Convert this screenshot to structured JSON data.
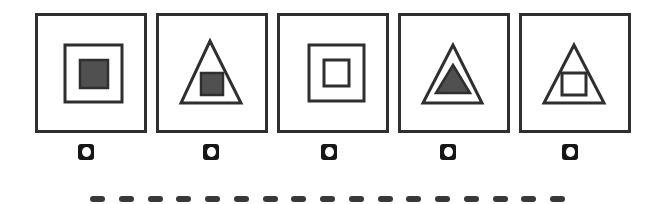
{
  "colors": {
    "background": "#ffffff",
    "outline": "#2f2f2f",
    "shape_fill": "#505050",
    "button_bg": "#161616",
    "button_dot": "#ffffff",
    "dash": "#383838"
  },
  "panels": [
    {
      "id": "option-panel-1",
      "description": "square outline containing large filled dark square",
      "shapes": [
        {
          "type": "rect",
          "x": 27,
          "y": 29,
          "w": 57,
          "h": 57,
          "filled": false
        },
        {
          "type": "rect",
          "x": 42,
          "y": 44,
          "w": 28,
          "h": 28,
          "filled": true
        }
      ]
    },
    {
      "id": "option-panel-2",
      "description": "triangle outline containing filled dark square",
      "shapes": [
        {
          "type": "polygon",
          "points": [
            [
              51,
              25
            ],
            [
              22,
              87
            ],
            [
              82,
              87
            ]
          ],
          "filled": false
        },
        {
          "type": "rect",
          "x": 42,
          "y": 57,
          "w": 22,
          "h": 22,
          "filled": true
        }
      ]
    },
    {
      "id": "option-panel-3",
      "description": "square outline containing small square outline",
      "shapes": [
        {
          "type": "rect",
          "x": 29,
          "y": 29,
          "w": 55,
          "h": 56,
          "filled": false
        },
        {
          "type": "rect",
          "x": 44,
          "y": 44,
          "w": 25,
          "h": 26,
          "filled": false
        }
      ]
    },
    {
      "id": "option-panel-4",
      "description": "triangle outline containing filled dark triangle",
      "shapes": [
        {
          "type": "polygon",
          "points": [
            [
              52,
              29
            ],
            [
              22,
              87
            ],
            [
              81,
              87
            ]
          ],
          "filled": false
        },
        {
          "type": "polygon",
          "points": [
            [
              52,
              49
            ],
            [
              35,
              77
            ],
            [
              69,
              77
            ]
          ],
          "filled": true
        }
      ]
    },
    {
      "id": "option-panel-5",
      "description": "triangle outline containing small square outline",
      "shapes": [
        {
          "type": "polygon",
          "points": [
            [
              52,
              29
            ],
            [
              22,
              87
            ],
            [
              82,
              87
            ]
          ],
          "filled": false
        },
        {
          "type": "rect",
          "x": 40,
          "y": 57,
          "w": 24,
          "h": 22,
          "filled": false
        }
      ]
    }
  ],
  "buttons": [
    {
      "id": "option-radio-1",
      "selected": false
    },
    {
      "id": "option-radio-2",
      "selected": false
    },
    {
      "id": "option-radio-3",
      "selected": false
    },
    {
      "id": "option-radio-4",
      "selected": false
    },
    {
      "id": "option-radio-5",
      "selected": false
    }
  ],
  "answer_line": {
    "dash_count": 17
  }
}
